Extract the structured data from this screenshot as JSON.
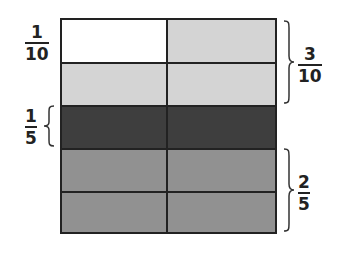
{
  "diagram": {
    "type": "fraction-model",
    "grid": {
      "rows": 5,
      "columns": 2
    },
    "rows": [
      {
        "cells": [
          {
            "shade": "white"
          },
          {
            "shade": "light"
          }
        ]
      },
      {
        "cells": [
          {
            "shade": "light"
          },
          {
            "shade": "light"
          }
        ]
      },
      {
        "cells": [
          {
            "shade": "dark"
          },
          {
            "shade": "dark"
          }
        ]
      },
      {
        "cells": [
          {
            "shade": "medium"
          },
          {
            "shade": "medium"
          }
        ]
      },
      {
        "cells": [
          {
            "shade": "medium"
          },
          {
            "shade": "medium"
          }
        ]
      }
    ],
    "colors": {
      "white": "#ffffff",
      "light": "#d4d4d4",
      "dark": "#3e3e3e",
      "medium": "#919191",
      "border": "#222222"
    },
    "labels": {
      "one_tenth": {
        "numerator": "1",
        "denominator": "10",
        "side": "left"
      },
      "three_tenths": {
        "numerator": "3",
        "denominator": "10",
        "side": "right"
      },
      "one_fifth": {
        "numerator": "1",
        "denominator": "5",
        "side": "left"
      },
      "two_fifths": {
        "numerator": "2",
        "denominator": "5",
        "side": "right"
      }
    }
  }
}
